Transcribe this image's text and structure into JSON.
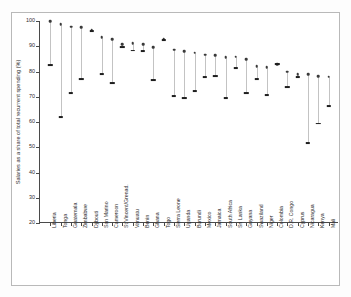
{
  "chart_data": {
    "type": "scatter",
    "title": "",
    "xlabel": "",
    "ylabel": "Salaries as a share of total recurrent spending (%)",
    "ylim": [
      20,
      100
    ],
    "yticks": [
      20,
      30,
      40,
      50,
      60,
      70,
      80,
      90,
      100
    ],
    "grid": false,
    "legend": "none",
    "categories": [
      "Liberia",
      "Tonga",
      "Guatemala",
      "Zimbabwe",
      "Djibouti",
      "San Marino",
      "Cameroon",
      "St Vincent/Grenad.",
      "Vanuatu",
      "Benin",
      "Ghana",
      "Togo",
      "Sierra Leone",
      "Uganda",
      "Burundi",
      "Mexico",
      "Jamaica",
      "South Africa",
      "Sri Lanka",
      "Guyana",
      "Swaziland",
      "Niger",
      "Colombia",
      "D.R. Congo",
      "Cyprus",
      "Nicaragua",
      "Kenya",
      "Mali"
    ],
    "series": [
      {
        "name": "high",
        "marker": "circle",
        "values": [
          100.0,
          98.8,
          97.8,
          97.5,
          96.5,
          93.5,
          92.7,
          90.8,
          91.2,
          90.7,
          89.6,
          92.7,
          88.7,
          88.1,
          87.5,
          86.6,
          86.4,
          85.7,
          85.8,
          84.8,
          82.2,
          81.7,
          82.9,
          80.0,
          78.9,
          79.0,
          78.1,
          78.0
        ]
      },
      {
        "name": "low",
        "marker": "dash",
        "values": [
          82.4,
          61.9,
          71.3,
          76.9,
          96.1,
          78.9,
          75.6,
          89.7,
          88.3,
          88.2,
          76.6,
          92.5,
          70.3,
          69.5,
          72.3,
          77.8,
          78.3,
          69.6,
          81.2,
          71.4,
          76.9,
          70.6,
          83.1,
          73.8,
          77.7,
          51.6,
          59.4,
          66.3
        ]
      }
    ]
  }
}
